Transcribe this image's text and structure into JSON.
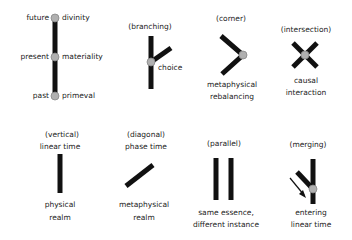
{
  "colors": {
    "line": "#111111",
    "node": "#b0b0b0",
    "node_stroke": "#888888",
    "text": "#222222",
    "background": "#ffffff"
  },
  "figures": [
    {
      "id": "timeline",
      "labels_left": [
        "future",
        "present",
        "past"
      ],
      "labels_right": [
        "divinity",
        "materiality",
        "primeval"
      ]
    },
    {
      "id": "branching",
      "title": "(branching)",
      "caption": "choice"
    },
    {
      "id": "corner",
      "title": "(corner)",
      "caption_lines": [
        "metaphysical",
        "rebalancing"
      ]
    },
    {
      "id": "intersection",
      "title": "(intersection)",
      "caption_lines": [
        "causal",
        "interaction"
      ]
    },
    {
      "id": "vertical",
      "title": "(vertical)",
      "subtitle": "linear time",
      "caption_lines": [
        "physical",
        "realm"
      ]
    },
    {
      "id": "diagonal",
      "title": "(diagonal)",
      "subtitle": "phase time",
      "caption_lines": [
        "metaphysical",
        "realm"
      ]
    },
    {
      "id": "parallel",
      "title": "(parallel)",
      "caption_lines": [
        "same essence,",
        "different instance"
      ]
    },
    {
      "id": "merging",
      "title": "(merging)",
      "caption_lines": [
        "entering",
        "linear time"
      ]
    }
  ]
}
